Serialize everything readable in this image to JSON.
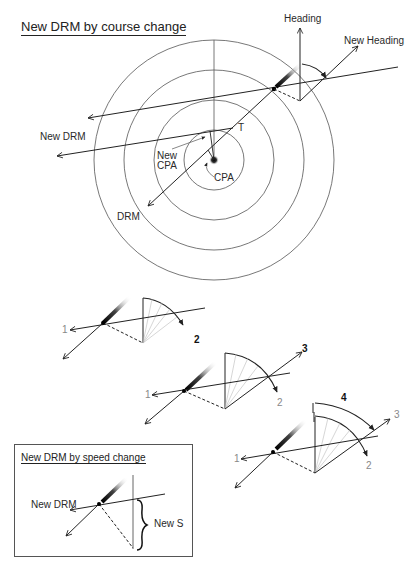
{
  "title": "New DRM by course change",
  "main_diagram": {
    "labels": {
      "heading": "Heading",
      "new_heading": "New Heading",
      "new_drm": "New DRM",
      "t": "T",
      "new_cpa_line1": "New",
      "new_cpa_line2": "CPA",
      "cpa": "CPA",
      "drm": "DRM"
    },
    "range_rings": 4
  },
  "step_diagrams": [
    {
      "labels": {
        "vector1": "1",
        "vector2": "2"
      },
      "bold_label": "2"
    },
    {
      "labels": {
        "vector1": "1",
        "vector2": "2",
        "vector3": "3"
      },
      "bold_label": "3"
    },
    {
      "labels": {
        "vector1": "1",
        "vector2": "2",
        "vector3": "3"
      },
      "bold_label": "4"
    }
  ],
  "speed_box": {
    "title": "New DRM by speed change",
    "labels": {
      "new_drm": "New DRM",
      "new_s": "New S"
    }
  },
  "colors": {
    "line": "#222222",
    "ring": "#555555",
    "faint": "#aaaaaa",
    "label_gray": "#888888"
  }
}
